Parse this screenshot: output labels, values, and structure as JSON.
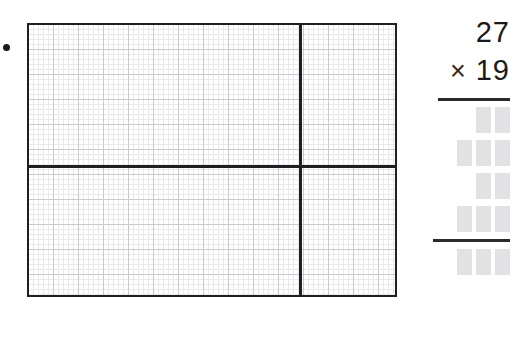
{
  "worksheet": {
    "bullet_marker": "•",
    "grid": {
      "label": "area-model-grid",
      "columns_left": 54,
      "columns_right": 19,
      "rows_top": 28,
      "rows_bottom": 26,
      "partition_vertical": true,
      "partition_horizontal": true,
      "cell_size_px": 5,
      "major_cell_size_px": 25,
      "border_color": "#1f1f1f",
      "minor_line_color": "#e9e9ee",
      "major_line_color": "#c9c9cf"
    },
    "problem": {
      "multiplicand": "27",
      "operator": "×",
      "multiplier": "19",
      "blank_box_color": "#e2e2e4",
      "rule_color": "#2b2b2b",
      "partial_product_rows": [
        {
          "name": "partial-product-row-1",
          "boxes": 2
        },
        {
          "name": "partial-product-row-2",
          "boxes": 3
        },
        {
          "name": "partial-product-row-3",
          "boxes": 2
        },
        {
          "name": "partial-product-row-4",
          "boxes": 3
        }
      ],
      "total_row": {
        "name": "total-row",
        "boxes": 3
      }
    }
  }
}
